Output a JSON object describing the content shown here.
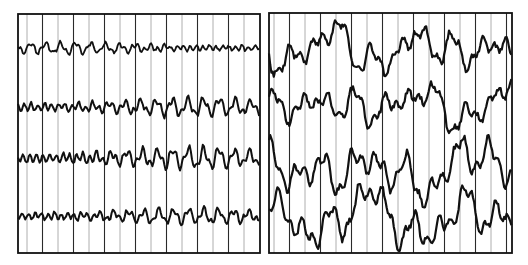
{
  "figure": {
    "width": 528,
    "height": 265,
    "background": "#ffffff",
    "ink": "#111111",
    "grid_light": "#9a9a9a",
    "grid_dark": "#2a2a2a"
  },
  "panels": [
    {
      "id": "left",
      "name": "left-eeg-panel",
      "x": 18,
      "y": 14,
      "width": 242,
      "height": 239,
      "grid_spacing": 15.5,
      "grid_offset": 9,
      "traces": [
        {
          "baseline": 34,
          "amp": 4.5,
          "freq": 0.42,
          "noise": 2.2,
          "stroke": 1.8,
          "seed": 11
        },
        {
          "baseline": 93,
          "amp": 7,
          "freq": 0.4,
          "noise": 2.5,
          "stroke": 2.0,
          "seed": 23
        },
        {
          "baseline": 144,
          "amp": 8,
          "freq": 0.41,
          "noise": 2.5,
          "stroke": 2.0,
          "seed": 37
        },
        {
          "baseline": 202,
          "amp": 6,
          "freq": 0.42,
          "noise": 2.4,
          "stroke": 2.0,
          "seed": 51
        }
      ]
    },
    {
      "id": "right",
      "name": "right-eeg-panel",
      "x": 269,
      "y": 13,
      "width": 243,
      "height": 240,
      "grid_spacing": 15.5,
      "grid_offset": 5,
      "traces": [
        {
          "baseline": 36,
          "amp": 16,
          "freq": 0.07,
          "noise": 5,
          "stroke": 2.2,
          "seed": 71
        },
        {
          "baseline": 92,
          "amp": 15,
          "freq": 0.07,
          "noise": 5,
          "stroke": 2.2,
          "seed": 83
        },
        {
          "baseline": 158,
          "amp": 20,
          "freq": 0.06,
          "noise": 5,
          "stroke": 2.2,
          "seed": 97
        },
        {
          "baseline": 205,
          "amp": 20,
          "freq": 0.06,
          "noise": 5,
          "stroke": 2.2,
          "seed": 103
        }
      ]
    }
  ]
}
